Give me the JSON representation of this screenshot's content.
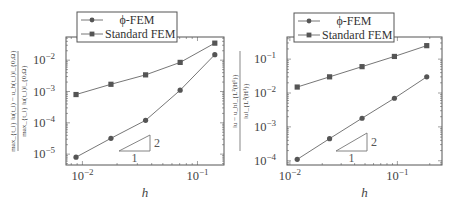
{
  "chart_data": [
    {
      "type": "line",
      "panel": "left",
      "title": "",
      "xlabel": "h",
      "ylabel": "max_{t_i} ||u(t_i) - u_h(t_i)||_{0,Ω} / max_{t_i} ||u(t_i)||_{0,Ω}",
      "ylabel_num": "max_{t_i} ‖u(t_i) − u_h(t_i)‖_{0,Ω}",
      "ylabel_den": "max_{t_i} ‖u(t_i)‖_{0,Ω}",
      "xscale": "log",
      "yscale": "log",
      "xlim": [
        0.0072,
        0.17
      ],
      "ylim": [
        4.5e-06,
        0.055
      ],
      "xticks": [
        {
          "value": 0.01,
          "base": "10",
          "exp": "−2"
        },
        {
          "value": 0.1,
          "base": "10",
          "exp": "−1"
        }
      ],
      "yticks": [
        {
          "value": 0.01,
          "base": "10",
          "exp": "−2"
        },
        {
          "value": 0.001,
          "base": "10",
          "exp": "−3"
        },
        {
          "value": 0.0001,
          "base": "10",
          "exp": "−4"
        },
        {
          "value": 1e-05,
          "base": "10",
          "exp": "−5"
        }
      ],
      "x": [
        0.0088,
        0.0177,
        0.0354,
        0.0707,
        0.1414
      ],
      "series": [
        {
          "name": "ϕ-FEM",
          "marker": "circle",
          "values": [
            8e-06,
            3.2e-05,
            0.00012,
            0.0011,
            0.015
          ]
        },
        {
          "name": "Standard FEM",
          "marker": "square",
          "values": [
            0.0008,
            0.0017,
            0.0034,
            0.0085,
            0.035
          ]
        }
      ],
      "legend": {
        "position": "upper left (outside top)",
        "entries": [
          "ϕ-FEM",
          "Standard FEM"
        ]
      },
      "annotations": [
        {
          "type": "slope-triangle",
          "run_label": "1",
          "rise_label": "2"
        }
      ],
      "grid": false
    },
    {
      "type": "line",
      "panel": "right",
      "title": "",
      "xlabel": "h",
      "ylabel": "||u - u_h||_{L²(H¹)} / ||u||_{L²(H¹)}",
      "ylabel_num": "‖u − u_h‖_{L²(H¹)}",
      "ylabel_den": "‖u‖_{L²(H¹)}",
      "xscale": "log",
      "yscale": "log",
      "xlim": [
        0.0094,
        0.26
      ],
      "ylim": [
        7.5e-05,
        0.45
      ],
      "xticks": [
        {
          "value": 0.01,
          "base": "10",
          "exp": "−2"
        },
        {
          "value": 0.1,
          "base": "10",
          "exp": "−1"
        }
      ],
      "yticks": [
        {
          "value": 0.1,
          "base": "10",
          "exp": "−1"
        },
        {
          "value": 0.01,
          "base": "10",
          "exp": "−2"
        },
        {
          "value": 0.001,
          "base": "10",
          "exp": "−3"
        },
        {
          "value": 0.0001,
          "base": "10",
          "exp": "−4"
        }
      ],
      "x": [
        0.0117,
        0.0234,
        0.0469,
        0.0938,
        0.1875
      ],
      "series": [
        {
          "name": "ϕ-FEM",
          "marker": "circle",
          "values": [
            0.00011,
            0.00045,
            0.0018,
            0.007,
            0.03
          ]
        },
        {
          "name": "Standard FEM",
          "marker": "square",
          "values": [
            0.015,
            0.03,
            0.06,
            0.12,
            0.25
          ]
        }
      ],
      "legend": {
        "position": "upper left (outside top)",
        "entries": [
          "ϕ-FEM",
          "Standard FEM"
        ]
      },
      "annotations": [
        {
          "type": "slope-triangle",
          "run_label": "1",
          "rise_label": "2"
        }
      ],
      "grid": false
    }
  ],
  "colors": {
    "axis": "#555555",
    "line": "#666666",
    "marker": "#555555",
    "text": "#444444"
  }
}
